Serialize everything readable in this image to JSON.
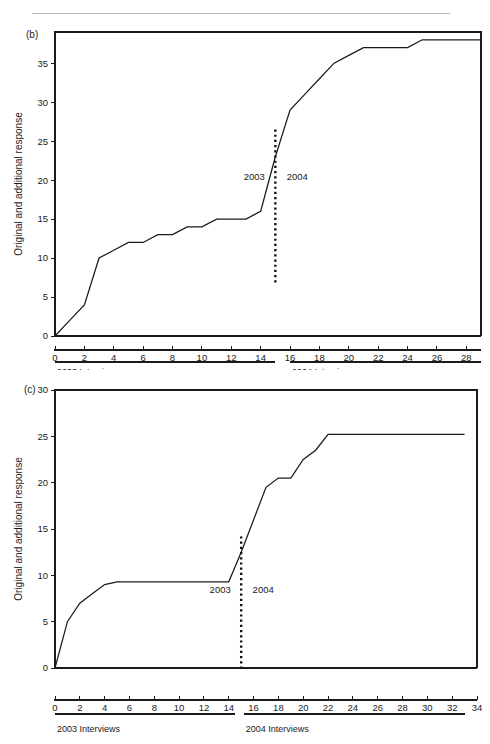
{
  "page": {
    "ghost_header": "",
    "background": "#ffffff",
    "ink": "#1a1a1a"
  },
  "chart_data": [
    {
      "id": "b",
      "type": "line",
      "panel_label": "(b)",
      "title": "",
      "xlabel": "",
      "ylabel": "Original and additional response",
      "xlim": [
        0,
        29
      ],
      "ylim": [
        0,
        39
      ],
      "grid": false,
      "legend": "none",
      "xticks": [
        0,
        2,
        4,
        6,
        8,
        10,
        12,
        14,
        16,
        18,
        20,
        22,
        24,
        26,
        28
      ],
      "yticks": [
        0,
        5,
        10,
        15,
        20,
        25,
        30,
        35
      ],
      "x": [
        0,
        1,
        2,
        3,
        4,
        5,
        6,
        7,
        8,
        9,
        10,
        11,
        12,
        13,
        14,
        15,
        16,
        17,
        18,
        19,
        20,
        21,
        22,
        23,
        24,
        25,
        26,
        27,
        28,
        29
      ],
      "values": [
        0,
        2,
        4,
        10,
        11,
        12,
        12,
        13,
        13,
        14,
        14,
        15,
        15,
        15,
        16,
        23,
        29,
        31,
        33,
        35,
        36,
        37,
        37,
        37,
        37,
        38,
        38,
        38,
        38,
        38
      ],
      "divider": {
        "x": 15,
        "y_top": 26.5,
        "y_bottom": 6.5,
        "label_left": "2003",
        "label_right": "2004",
        "label_y": 20
      },
      "brackets": [
        {
          "label": "2003 Interviews",
          "x_start": 0,
          "x_end": 15
        },
        {
          "label": "2004 Interviews",
          "x_start": 16,
          "x_end": 29
        }
      ]
    },
    {
      "id": "c",
      "type": "line",
      "panel_label": "(c)",
      "title": "",
      "xlabel": "",
      "ylabel": "Original and additional response",
      "xlim": [
        0,
        34
      ],
      "ylim": [
        0,
        30
      ],
      "grid": false,
      "legend": "none",
      "xticks": [
        0,
        2,
        4,
        6,
        8,
        10,
        12,
        14,
        16,
        18,
        20,
        22,
        24,
        26,
        28,
        30,
        32,
        34
      ],
      "yticks": [
        0,
        5,
        10,
        15,
        20,
        25,
        30
      ],
      "x": [
        0,
        1,
        2,
        3,
        4,
        5,
        6,
        7,
        8,
        9,
        10,
        11,
        12,
        13,
        14,
        15,
        16,
        17,
        18,
        19,
        20,
        21,
        22,
        23,
        24,
        25,
        26,
        27,
        28,
        29,
        30,
        31,
        32,
        33
      ],
      "values": [
        0,
        5,
        7,
        8,
        9,
        9.3,
        9.3,
        9.3,
        9.3,
        9.3,
        9.3,
        9.3,
        9.3,
        9.3,
        9.3,
        12.5,
        16,
        19.5,
        20.5,
        20.5,
        22.5,
        23.5,
        25.2,
        25.2,
        25.2,
        25.2,
        25.2,
        25.2,
        25.2,
        25.2,
        25.2,
        25.2,
        25.2,
        25.2
      ],
      "divider": {
        "x": 15,
        "y_top": 14.2,
        "y_bottom": 0.0,
        "label_left": "2003",
        "label_right": "2004",
        "label_y": 8.1
      },
      "brackets": [
        {
          "label": "2003 Interviews",
          "x_start": 0,
          "x_end": 14.5
        },
        {
          "label": "2004 Interviews",
          "x_start": 15.2,
          "x_end": 33
        }
      ]
    }
  ]
}
